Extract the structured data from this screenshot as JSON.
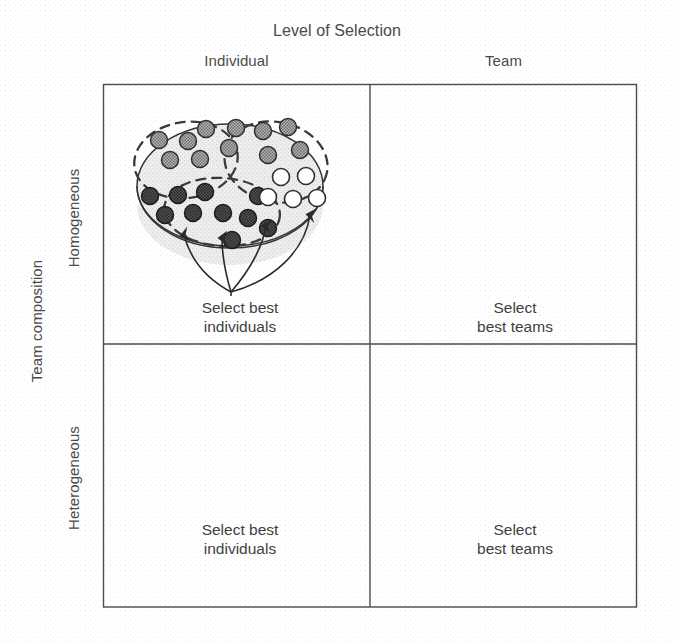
{
  "figure": {
    "top_title": "Level of Selection",
    "x_axis_title": "Level of Selection",
    "y_axis_title": "Team composition",
    "columns": [
      "Individual",
      "Team"
    ],
    "rows": [
      "Homogeneous",
      "Heterogeneous"
    ],
    "frame": {
      "left": 103,
      "top": 84,
      "right": 637,
      "bottom": 607,
      "divider_x": 370,
      "divider_y": 344
    },
    "colors": {
      "line": "#2e2e2e",
      "population_fill": "#e9e9e9",
      "team_fill": "#ededed",
      "shade_dark": "#4a4a4a",
      "shade_medium": "#8f8f8f",
      "shade_light": "#ffffff",
      "text": "#414141",
      "page_background": "#ffffff"
    }
  },
  "quadrants": {
    "top_left": {
      "row": "Homogeneous",
      "column": "Individual",
      "caption_line1": "Select best",
      "caption_line2": "individuals",
      "selection_unit": "individual",
      "group_style": "dashed",
      "group_count": 3,
      "arrow_count": 4,
      "groups": [
        {
          "name": "group-medium",
          "shade": "medium",
          "members": 8
        },
        {
          "name": "group-dark",
          "shade": "dark",
          "members": 10
        },
        {
          "name": "group-light",
          "shade": "light",
          "members": 6
        }
      ]
    },
    "top_right": {
      "row": "Homogeneous",
      "column": "Team",
      "caption_line1": "Select",
      "caption_line2": "best teams",
      "selection_unit": "team",
      "group_style": "solid",
      "group_count": 5,
      "arrow_count": 2,
      "teams": [
        {
          "name": "team-1",
          "shades": [
            "medium",
            "medium",
            "medium",
            "medium",
            "medium"
          ]
        },
        {
          "name": "team-2",
          "shades": [
            "medium",
            "medium",
            "medium",
            "medium",
            "medium"
          ]
        },
        {
          "name": "team-3",
          "shades": [
            "dark",
            "dark",
            "dark",
            "dark",
            "dark"
          ]
        },
        {
          "name": "team-4",
          "shades": [
            "medium",
            "medium",
            "medium",
            "medium",
            "medium"
          ]
        },
        {
          "name": "team-5",
          "shades": [
            "light",
            "light",
            "light",
            "light",
            "light"
          ]
        }
      ]
    },
    "bottom_left": {
      "row": "Heterogeneous",
      "column": "Individual",
      "caption_line1": "Select best",
      "caption_line2": "individuals",
      "selection_unit": "individual",
      "group_style": "dashed",
      "group_count": 3,
      "arrow_count": 4,
      "groups": [
        {
          "name": "group-1",
          "shade": "mixed",
          "members": 9
        },
        {
          "name": "group-2",
          "shade": "mixed",
          "members": 10
        },
        {
          "name": "group-3",
          "shade": "mixed",
          "members": 9
        }
      ]
    },
    "bottom_right": {
      "row": "Heterogeneous",
      "column": "Team",
      "caption_line1": "Select",
      "caption_line2": "best teams",
      "selection_unit": "team",
      "group_style": "solid",
      "group_count": 5,
      "arrow_count": 2,
      "teams": [
        {
          "name": "team-1",
          "shades": [
            "dark",
            "medium",
            "light",
            "dark",
            "medium"
          ]
        },
        {
          "name": "team-2",
          "shades": [
            "medium",
            "light",
            "dark",
            "dark",
            "medium"
          ]
        },
        {
          "name": "team-3",
          "shades": [
            "light",
            "medium",
            "dark",
            "medium",
            "dark"
          ]
        },
        {
          "name": "team-4",
          "shades": [
            "light",
            "medium",
            "dark",
            "medium",
            "dark"
          ]
        },
        {
          "name": "team-5",
          "shades": [
            "light",
            "medium",
            "dark",
            "medium",
            "dark"
          ]
        }
      ]
    }
  }
}
